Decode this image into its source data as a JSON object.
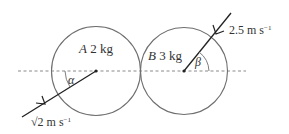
{
  "diagram": {
    "line_of_centres": "dashed horizontal",
    "spheres": [
      {
        "id": "A",
        "name": "A",
        "mass": "2 kg",
        "label": "A 2kg",
        "angle_symbol": "α",
        "speed": "√2 m s⁻¹",
        "speed_value": "√2",
        "speed_unit": "m s",
        "speed_exp": "−1",
        "velocity_direction": "towards centre from lower-left"
      },
      {
        "id": "B",
        "name": "B",
        "mass": "3 kg",
        "label": "B 3kg",
        "angle_symbol": "β",
        "speed": "2.5 m s⁻¹",
        "speed_value": "2.5",
        "speed_unit": "m s",
        "speed_exp": "−1",
        "velocity_direction": "towards centre from upper-right"
      }
    ],
    "colors": {
      "circle": "#6e6e6e",
      "line": "#222222",
      "dashed": "#888888",
      "text": "#333333"
    }
  }
}
